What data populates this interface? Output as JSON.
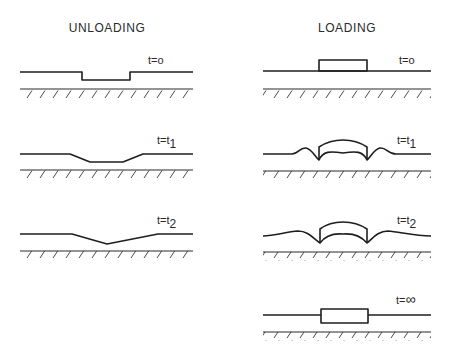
{
  "diagram": {
    "columns": [
      {
        "title": "UNLOADING",
        "panels": [
          {
            "label_base": "t=",
            "label_var": "o",
            "label_sub": ""
          },
          {
            "label_base": "t=t",
            "label_var": "",
            "label_sub": "1"
          },
          {
            "label_base": "t=t",
            "label_var": "",
            "label_sub": "2"
          }
        ]
      },
      {
        "title": "LOADING",
        "panels": [
          {
            "label_base": "t=",
            "label_var": "o",
            "label_sub": ""
          },
          {
            "label_base": "t=t",
            "label_var": "",
            "label_sub": "1"
          },
          {
            "label_base": "t=t",
            "label_var": "",
            "label_sub": "2"
          },
          {
            "label_base": "t=",
            "label_var": "∞",
            "label_sub": ""
          }
        ]
      }
    ]
  }
}
